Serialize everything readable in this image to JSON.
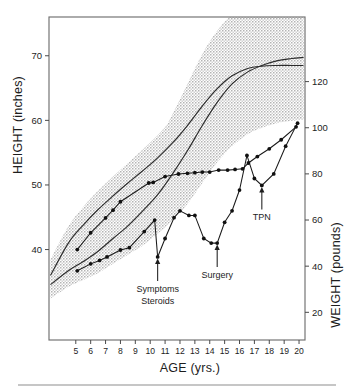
{
  "figure": {
    "title": "",
    "bottom_rule": true
  },
  "axes": {
    "x": {
      "label": "AGE (yrs.)",
      "ticks": [
        5,
        6,
        7,
        8,
        9,
        10,
        11,
        12,
        13,
        14,
        15,
        16,
        17,
        18,
        19,
        20
      ],
      "range": [
        3.2,
        20.4
      ]
    },
    "y_left": {
      "label": "HEIGHT (inches)",
      "ticks": [
        40,
        50,
        60,
        70
      ],
      "range": [
        26,
        76
      ]
    },
    "y_right": {
      "label": "WEIGHT (pounds)",
      "ticks": [
        20,
        40,
        60,
        80,
        100,
        120
      ],
      "range": [
        8,
        148
      ]
    }
  },
  "annotations": [
    {
      "name": "symptoms-steroids",
      "lines": [
        "Symptoms",
        "Steroids"
      ],
      "age": 10.5
    },
    {
      "name": "surgery",
      "lines": [
        "Surgery"
      ],
      "age": 14.5
    },
    {
      "name": "tpn",
      "lines": [
        "TPN"
      ],
      "age": 17.5
    }
  ],
  "colors": {
    "band_fill": "#c9c9c9",
    "curve": "#1a1a1a",
    "frame": "#6f6f6f",
    "text": "#1d1d1d"
  },
  "chart_data": {
    "type": "line",
    "title": "",
    "xlabel": "AGE (yrs.)",
    "ylabel": "HEIGHT (inches)",
    "y2label": "WEIGHT (pounds)",
    "xlim": [
      3.2,
      20.4
    ],
    "ylim": [
      26,
      76
    ],
    "y2lim": [
      8,
      148
    ],
    "grid": false,
    "legend": "none",
    "series": [
      {
        "name": "Patient height",
        "axis": "left",
        "units": "inches",
        "marker": "filled-circle",
        "x": [
          5.1,
          6.0,
          7.0,
          7.5,
          8.0,
          9.9,
          10.2,
          11.0,
          11.9,
          12.5,
          13.0,
          13.5,
          14.0,
          14.6,
          15.2,
          15.7,
          16.2,
          16.6,
          17.2,
          18.0,
          18.8,
          19.8
        ],
        "y": [
          40.0,
          42.6,
          44.9,
          46.1,
          47.4,
          50.3,
          50.4,
          51.3,
          51.7,
          51.8,
          51.9,
          52.0,
          52.0,
          52.3,
          52.3,
          52.4,
          52.5,
          53.4,
          54.4,
          55.6,
          57.0,
          59.0
        ]
      },
      {
        "name": "Normal height reference",
        "axis": "left",
        "units": "inches",
        "marker": "none",
        "x": [
          3.3,
          4.5,
          5.5,
          6.5,
          7.5,
          8.5,
          9.5,
          10.5,
          11.5,
          12.5,
          13.5,
          14.5,
          15.5,
          16.5,
          17.5,
          18.5,
          19.5,
          20.3
        ],
        "y": [
          36.0,
          41.0,
          43.8,
          46.2,
          48.3,
          50.3,
          52.2,
          54.2,
          56.5,
          59.2,
          62.2,
          64.9,
          66.9,
          68.0,
          68.4,
          68.5,
          68.5,
          68.5
        ]
      },
      {
        "name": "Normal height band",
        "axis": "left",
        "units": "inches",
        "type": "band",
        "x": [
          3.3,
          4.5,
          5.5,
          6.5,
          7.5,
          8.5,
          9.5,
          10.5,
          11.5,
          12.5,
          13.5,
          14.5,
          15.5,
          16.5,
          17.5,
          18.5,
          19.5,
          20.3
        ],
        "upper": [
          38.4,
          43.6,
          46.6,
          49.1,
          51.3,
          53.4,
          55.5,
          57.7,
          60.2,
          63.1,
          66.1,
          68.7,
          70.6,
          71.6,
          72.1,
          72.3,
          72.3,
          72.3
        ],
        "lower": [
          33.6,
          38.4,
          41.0,
          43.3,
          45.3,
          47.2,
          49.0,
          50.8,
          52.9,
          55.4,
          58.3,
          61.1,
          63.2,
          64.4,
          64.8,
          64.9,
          64.9,
          64.9
        ]
      },
      {
        "name": "Patient weight",
        "axis": "right",
        "units": "pounds",
        "marker": "filled-circle",
        "x": [
          5.1,
          6.0,
          6.6,
          7.1,
          8.0,
          8.6,
          9.6,
          10.3,
          10.5,
          11.0,
          11.6,
          12.0,
          12.6,
          13.0,
          13.6,
          14.1,
          14.5,
          15.0,
          15.5,
          16.0,
          16.5,
          17.0,
          17.5,
          18.3,
          19.1,
          19.9
        ],
        "y": [
          38.0,
          41.0,
          42.5,
          44.0,
          47.0,
          48.0,
          55.0,
          60.0,
          44.0,
          52.0,
          61.0,
          64.0,
          62.0,
          62.0,
          52.0,
          50.0,
          50.0,
          59.0,
          64.0,
          73.0,
          88.0,
          78.0,
          75.0,
          80.0,
          92.0,
          102.0
        ]
      },
      {
        "name": "Normal weight reference",
        "axis": "right",
        "units": "pounds",
        "marker": "none",
        "x": [
          3.3,
          4.5,
          5.5,
          6.5,
          7.5,
          8.5,
          9.5,
          10.5,
          11.5,
          12.5,
          13.5,
          14.5,
          15.5,
          16.5,
          17.5,
          18.5,
          19.5,
          20.3
        ],
        "y": [
          32.0,
          38.0,
          42.0,
          46.5,
          52.0,
          57.5,
          64.0,
          71.0,
          80.0,
          90.0,
          101.0,
          111.0,
          119.0,
          124.0,
          127.0,
          129.0,
          130.0,
          130.5
        ]
      },
      {
        "name": "Normal weight band",
        "axis": "right",
        "units": "pounds",
        "type": "band",
        "x": [
          3.3,
          4.5,
          5.5,
          6.5,
          7.5,
          8.5,
          9.5,
          10.5,
          11.5,
          12.5,
          13.5,
          14.5,
          15.5,
          16.5,
          17.5,
          18.5,
          19.5,
          20.3
        ],
        "upper": [
          38.0,
          45.0,
          51.0,
          58.0,
          66.0,
          74.0,
          84.0,
          94.0,
          106.0,
          119.0,
          132.0,
          142.0,
          149.0,
          153.0,
          155.0,
          156.0,
          156.0,
          156.0
        ],
        "lower": [
          26.0,
          31.0,
          34.0,
          37.0,
          41.0,
          45.0,
          49.0,
          54.0,
          60.0,
          67.0,
          76.0,
          85.0,
          92.0,
          97.0,
          100.0,
          102.0,
          103.0,
          103.5
        ]
      }
    ],
    "annotations": [
      {
        "text": "Symptoms Steroids",
        "x": 10.5,
        "axis": "right",
        "points_to": 44
      },
      {
        "text": "Surgery",
        "x": 14.5,
        "axis": "right",
        "points_to": 50
      },
      {
        "text": "TPN",
        "x": 17.5,
        "axis": "right",
        "points_to": 75
      }
    ]
  }
}
